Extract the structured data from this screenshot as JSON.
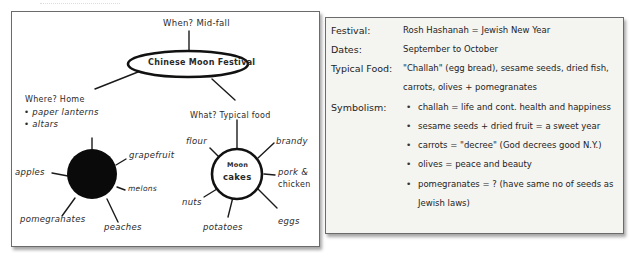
{
  "mind_map": {
    "title": "Chinese Moon Festival",
    "when": "When? Mid-fall",
    "where": {
      "label": "Where? Home",
      "bullets": [
        "paper lanterns",
        "altars"
      ]
    },
    "what": {
      "label": "What? Typical food",
      "center": [
        "Moon",
        "cakes"
      ],
      "spokes": [
        "flour",
        "brandy",
        "pork &",
        "chicken",
        "eggs",
        "potatoes",
        "nuts"
      ]
    },
    "fruit_node": {
      "spokes": [
        "grapefruit",
        "melons",
        "peaches",
        "pomegranates",
        "apples"
      ]
    }
  },
  "info_card": {
    "festival_label": "Festival:",
    "festival_value": "Rosh Hashanah = Jewish New Year",
    "dates_label": "Dates:",
    "dates_value": "September to October",
    "food_label": "Typical Food:",
    "food_value_line1": "\"Challah\" (egg bread), sesame seeds, dried fish,",
    "food_value_line2": "carrots, olives + pomegranates",
    "symbolism_label": "Symbolism:",
    "symbolism": [
      "challah = life and cont. health and happiness",
      "sesame seeds + dried fruit = a sweet year",
      "carrots = \"decree\" (God decrees good N.Y.)",
      "olives = peace and beauty",
      "pomegranates = ? (have same no of seeds as"
    ],
    "symbolism_continuation": "Jewish laws)",
    "bullet_glyph": "•"
  },
  "colors": {
    "ink": "#1a1a1a",
    "card_bg": "#f4f4f1",
    "border": "#6b6b6b"
  }
}
